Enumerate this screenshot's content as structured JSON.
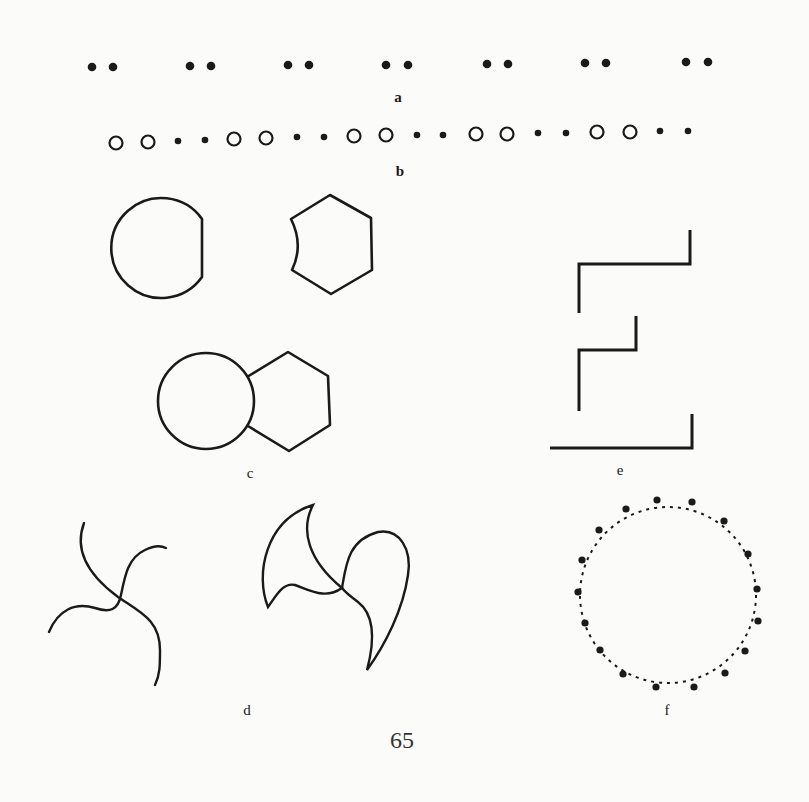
{
  "page": {
    "background": "#fbfbf9",
    "ink": "#1a1a1a",
    "page_number": "65"
  },
  "figures": {
    "a": {
      "label": "a",
      "description": "Seven pairs of black dots grouped by proximity",
      "dot_pairs_x": [
        [
          92,
          113
        ],
        [
          190,
          211
        ],
        [
          288,
          309
        ],
        [
          386,
          408
        ],
        [
          487,
          508
        ],
        [
          585,
          606
        ],
        [
          686,
          708
        ]
      ],
      "dot_y": [
        67,
        66,
        65,
        65,
        64,
        63,
        62
      ]
    },
    "b": {
      "label": "b",
      "description": "Row alternating pairs of open circles and pairs of black dots (similarity grouping)",
      "items": [
        {
          "type": "open",
          "x": 116,
          "y": 143
        },
        {
          "type": "open",
          "x": 148,
          "y": 142
        },
        {
          "type": "dot",
          "x": 178,
          "y": 141
        },
        {
          "type": "dot",
          "x": 205,
          "y": 140
        },
        {
          "type": "open",
          "x": 234,
          "y": 139
        },
        {
          "type": "open",
          "x": 266,
          "y": 138
        },
        {
          "type": "dot",
          "x": 297,
          "y": 137
        },
        {
          "type": "dot",
          "x": 324,
          "y": 137
        },
        {
          "type": "open",
          "x": 354,
          "y": 136
        },
        {
          "type": "open",
          "x": 386,
          "y": 135
        },
        {
          "type": "dot",
          "x": 417,
          "y": 135
        },
        {
          "type": "dot",
          "x": 443,
          "y": 135
        },
        {
          "type": "open",
          "x": 476,
          "y": 134
        },
        {
          "type": "open",
          "x": 507,
          "y": 134
        },
        {
          "type": "dot",
          "x": 538,
          "y": 133
        },
        {
          "type": "dot",
          "x": 566,
          "y": 133
        },
        {
          "type": "open",
          "x": 597,
          "y": 132
        },
        {
          "type": "open",
          "x": 630,
          "y": 132
        },
        {
          "type": "dot",
          "x": 660,
          "y": 131
        },
        {
          "type": "dot",
          "x": 688,
          "y": 131
        }
      ]
    },
    "c": {
      "label": "c",
      "description": "Truncated circle and notched hexagon shown separately and then overlapping"
    },
    "d": {
      "label": "d",
      "description": "Crossing curves perceived as continuous lines, and an embedded version"
    },
    "e": {
      "label": "e",
      "description": "Three open bracket-like line figures (closure)"
    },
    "f": {
      "label": "f",
      "description": "Dotted circle with black dots arranged around it",
      "circle": {
        "cx": 668,
        "cy": 595,
        "r": 88
      },
      "dots": [
        [
          657,
          500
        ],
        [
          692,
          502
        ],
        [
          724,
          521
        ],
        [
          748,
          554
        ],
        [
          757,
          589
        ],
        [
          758,
          621
        ],
        [
          745,
          651
        ],
        [
          725,
          673
        ],
        [
          694,
          687
        ],
        [
          656,
          687
        ],
        [
          623,
          674
        ],
        [
          600,
          650
        ],
        [
          585,
          623
        ],
        [
          578,
          592
        ],
        [
          582,
          560
        ],
        [
          599,
          530
        ],
        [
          626,
          509
        ]
      ]
    }
  }
}
